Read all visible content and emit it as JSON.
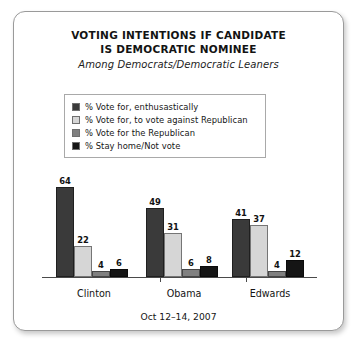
{
  "card": {
    "title_line1": "VOTING INTENTIONS IF CANDIDATE",
    "title_line2": "IS DEMOCRATIC NOMINEE",
    "subtitle": "Among Democrats/Democratic Leaners",
    "footer": "Oct 12–14, 2007"
  },
  "colors": {
    "series1": "#3a3a3a",
    "series2": "#d6d6d6",
    "series3": "#808080",
    "series4": "#151515",
    "axis": "#4a4a4a",
    "border": "#9a9a9a",
    "background": "#ffffff"
  },
  "chart_data": {
    "type": "bar",
    "title": "VOTING INTENTIONS IF CANDIDATE IS DEMOCRATIC NOMINEE",
    "subtitle": "Among Democrats/Democratic Leaners",
    "caption": "Oct 12–14, 2007",
    "xlabel": "",
    "ylabel": "",
    "ylim": [
      0,
      70
    ],
    "grid": false,
    "legend_position": "top-center",
    "grouped": true,
    "value_labels": true,
    "categories": [
      "Clinton",
      "Obama",
      "Edwards"
    ],
    "series": [
      {
        "name": "% Vote for, enthusastically",
        "color": "#3a3a3a",
        "values": [
          64,
          49,
          41
        ]
      },
      {
        "name": "% Vote for, to vote against Republican",
        "color": "#d6d6d6",
        "values": [
          22,
          31,
          37
        ]
      },
      {
        "name": "% Vote for the Republican",
        "color": "#808080",
        "values": [
          4,
          6,
          4
        ]
      },
      {
        "name": "% Stay home/Not vote",
        "color": "#151515",
        "values": [
          6,
          8,
          12
        ]
      }
    ]
  }
}
